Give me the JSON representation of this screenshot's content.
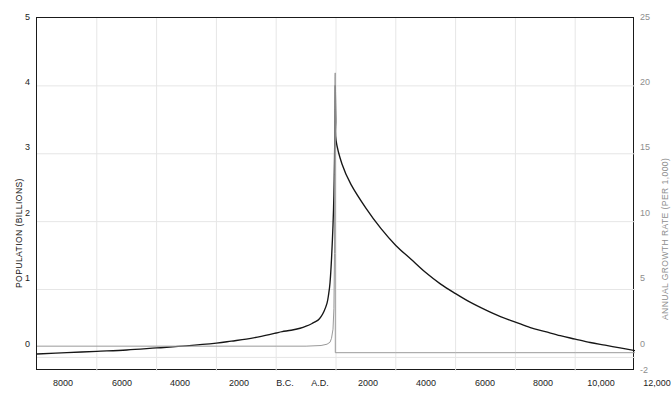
{
  "chart_data": {
    "type": "line",
    "title": "",
    "xlabel": "",
    "ylabel": "POPULATION (BILLIONS)",
    "ylabel_right": "ANNUAL GROWTH RATE (PER 1,000)",
    "grid": true,
    "legend": "none",
    "x_ticks": [
      "8000",
      "6000",
      "4000",
      "2000",
      "B.C.",
      "A.D.",
      "2000",
      "4000",
      "6000",
      "8000",
      "10,000",
      "12,000"
    ],
    "x_tick_values": [
      -8000,
      -6000,
      -4000,
      -2000,
      0,
      0,
      2000,
      4000,
      6000,
      8000,
      10000,
      12000
    ],
    "y_ticks_left": [
      "0",
      "1",
      "2",
      "3",
      "4",
      "5"
    ],
    "y_ticks_right": [
      "-2",
      "0",
      "5",
      "10",
      "15",
      "20",
      "25"
    ],
    "ylim_left": [
      -0.2,
      5
    ],
    "ylim_right": [
      -2,
      25
    ],
    "xlim": [
      -8000,
      12000
    ],
    "colors": {
      "population_line": "#161616",
      "growth_line": "#9a9a9a",
      "grid": "#e6e6e6",
      "frame": "#1a1a1a",
      "left_axis_text": "#1d1d1d",
      "right_axis_text": "#8e8e8e"
    },
    "series": [
      {
        "name": "Population (billions)",
        "axis": "left",
        "color": "#161616",
        "points": [
          [
            -8000,
            0.05
          ],
          [
            -7000,
            0.07
          ],
          [
            -6000,
            0.09
          ],
          [
            -5000,
            0.11
          ],
          [
            -4000,
            0.14
          ],
          [
            -3000,
            0.17
          ],
          [
            -2000,
            0.21
          ],
          [
            -1500,
            0.24
          ],
          [
            -1000,
            0.27
          ],
          [
            -500,
            0.31
          ],
          [
            -200,
            0.34
          ],
          [
            0,
            0.36
          ],
          [
            200,
            0.38
          ],
          [
            500,
            0.4
          ],
          [
            800,
            0.43
          ],
          [
            1000,
            0.46
          ],
          [
            1200,
            0.5
          ],
          [
            1400,
            0.55
          ],
          [
            1500,
            0.6
          ],
          [
            1600,
            0.68
          ],
          [
            1700,
            0.8
          ],
          [
            1750,
            0.92
          ],
          [
            1800,
            1.1
          ],
          [
            1850,
            1.45
          ],
          [
            1900,
            1.95
          ],
          [
            1930,
            2.4
          ],
          [
            1950,
            2.9
          ],
          [
            1960,
            3.3
          ],
          [
            1970,
            3.75
          ],
          [
            1975,
            4.0
          ],
          [
            1980,
            3.85
          ],
          [
            1990,
            3.5
          ],
          [
            2000,
            3.2
          ],
          [
            2200,
            2.85
          ],
          [
            2500,
            2.55
          ],
          [
            3000,
            2.2
          ],
          [
            3500,
            1.9
          ],
          [
            4000,
            1.65
          ],
          [
            4500,
            1.45
          ],
          [
            5000,
            1.25
          ],
          [
            5500,
            1.08
          ],
          [
            6000,
            0.94
          ],
          [
            6500,
            0.81
          ],
          [
            7000,
            0.7
          ],
          [
            7500,
            0.6
          ],
          [
            8000,
            0.52
          ],
          [
            8500,
            0.44
          ],
          [
            9000,
            0.38
          ],
          [
            9500,
            0.32
          ],
          [
            10000,
            0.27
          ],
          [
            10500,
            0.22
          ],
          [
            11000,
            0.18
          ],
          [
            11500,
            0.14
          ],
          [
            12000,
            0.1
          ]
        ]
      },
      {
        "name": "Annual growth rate (per 1,000)",
        "axis": "right",
        "color": "#9a9a9a",
        "points": [
          [
            -8000,
            -0.1
          ],
          [
            -4000,
            -0.1
          ],
          [
            0,
            -0.1
          ],
          [
            1000,
            -0.1
          ],
          [
            1500,
            -0.05
          ],
          [
            1700,
            0.05
          ],
          [
            1800,
            0.2
          ],
          [
            1850,
            0.5
          ],
          [
            1900,
            1.2
          ],
          [
            1930,
            2.8
          ],
          [
            1950,
            7.0
          ],
          [
            1960,
            13.0
          ],
          [
            1965,
            18.0
          ],
          [
            1968,
            20.5
          ],
          [
            1972,
            20.8
          ],
          [
            1975,
            20.8
          ],
          [
            1976,
            7.0
          ],
          [
            1977,
            -0.6
          ],
          [
            2000,
            -0.6
          ],
          [
            4000,
            -0.6
          ],
          [
            6000,
            -0.6
          ],
          [
            8000,
            -0.6
          ],
          [
            10000,
            -0.6
          ],
          [
            12000,
            -0.6
          ]
        ]
      }
    ]
  },
  "axes": {
    "left_title": "POPULATION (BILLIONS)",
    "right_title": "ANNUAL GROWTH RATE (PER 1,000)"
  },
  "ticks": {
    "left": [
      {
        "label": "5",
        "top": 13
      },
      {
        "label": "4",
        "top": 78
      },
      {
        "label": "3",
        "top": 143
      },
      {
        "label": "2",
        "top": 209
      },
      {
        "label": "1",
        "top": 274
      },
      {
        "label": "0",
        "top": 340
      }
    ],
    "right": [
      {
        "label": "25",
        "top": 13
      },
      {
        "label": "20",
        "top": 78
      },
      {
        "label": "15",
        "top": 143
      },
      {
        "label": "10",
        "top": 209
      },
      {
        "label": "5",
        "top": 274
      },
      {
        "label": "0",
        "top": 340
      },
      {
        "label": "-2",
        "top": 366
      }
    ],
    "bottom": [
      {
        "label": "8000",
        "left": 63
      },
      {
        "label": "6000",
        "left": 122
      },
      {
        "label": "4000",
        "left": 180
      },
      {
        "label": "2000",
        "left": 239
      },
      {
        "label": "B.C.",
        "left": 285
      },
      {
        "label": "A.D.",
        "left": 320
      },
      {
        "label": "2000",
        "left": 368
      },
      {
        "label": "4000",
        "left": 426
      },
      {
        "label": "6000",
        "left": 485
      },
      {
        "label": "8000",
        "left": 543
      },
      {
        "label": "10,000",
        "left": 601
      },
      {
        "label": "12,000",
        "left": 657
      }
    ]
  }
}
